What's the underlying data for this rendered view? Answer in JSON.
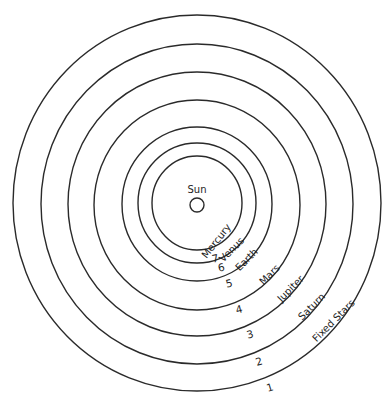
{
  "center": {
    "label": "Sun"
  },
  "spheres": [
    {
      "number": "7",
      "label": "Mercury"
    },
    {
      "number": "6",
      "label": "Venus"
    },
    {
      "number": "5",
      "label": "Earth"
    },
    {
      "number": "4",
      "label": "Mars"
    },
    {
      "number": "3",
      "label": "Jupiter"
    },
    {
      "number": "2",
      "label": "Saturn"
    },
    {
      "number": "1",
      "label": "Fixed Stars"
    }
  ],
  "colors": {
    "line": "#2a2a2a",
    "text": "#1e1e1e",
    "background": "#ffffff"
  }
}
